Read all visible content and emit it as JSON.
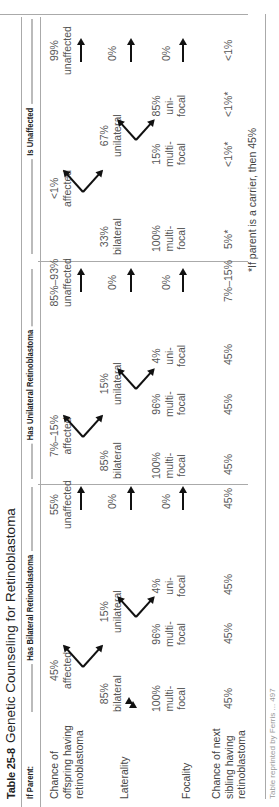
{
  "title": {
    "number": "Table 25-8",
    "text": "Genetic Counseling for Retinoblastoma"
  },
  "header": {
    "if_parent": "If Parent:",
    "groups": [
      "Has Bilateral Retinoblastoma",
      "Has Unilateral Retinoblastoma",
      "Is Unaffected"
    ]
  },
  "row_labels": {
    "offspring": [
      "Chance of",
      "offspring having",
      "retinoblastoma"
    ],
    "laterality": "Laterality",
    "focality": "Focality",
    "sibling": [
      "Chance of next",
      "sibling having",
      "retinoblastoma"
    ]
  },
  "bilateral": {
    "affected": [
      "45%",
      "affected"
    ],
    "unaffected": [
      "55%",
      "unaffected"
    ],
    "bilateral": [
      "85%",
      "bilateral"
    ],
    "unilateral": [
      "15%",
      "unilateral"
    ],
    "unaffected_laterality": "0%",
    "bil_focality": [
      "100%",
      "multi-",
      "focal"
    ],
    "uni_multi": [
      "96%",
      "multi-",
      "focal"
    ],
    "uni_uni": [
      "4%",
      "uni-",
      "focal"
    ],
    "unaffected_focality": "0%",
    "sibling": [
      "45%",
      "45%",
      "45%",
      "45%"
    ]
  },
  "unilateral": {
    "affected": [
      "7%–15%",
      "affected"
    ],
    "unaffected": [
      "85%–93%",
      "unaffected"
    ],
    "bilateral": [
      "85%",
      "bilateral"
    ],
    "unilateral": [
      "15%",
      "unilateral"
    ],
    "unaffected_laterality": "0%",
    "bil_focality": [
      "100%",
      "multi-",
      "focal"
    ],
    "uni_multi": [
      "96%",
      "multi-",
      "focal"
    ],
    "uni_uni": [
      "4%",
      "uni-",
      "focal"
    ],
    "unaffected_focality": "0%",
    "sibling": [
      "45%",
      "45%",
      "45%",
      "7%–15%"
    ]
  },
  "unaffected": {
    "affected": [
      "<1%",
      "affected"
    ],
    "unaffected": [
      "99%",
      "unaffected"
    ],
    "bilateral": [
      "33%",
      "bilateral"
    ],
    "unilateral": [
      "67%",
      "unilateral"
    ],
    "unaffected_laterality": "0%",
    "bil_focality": [
      "100%",
      "multi-",
      "focal"
    ],
    "uni_multi": [
      "15%",
      "multi-",
      "focal"
    ],
    "uni_uni": [
      "85%",
      "uni-",
      "focal"
    ],
    "unaffected_focality": "0%",
    "sibling": [
      "5%*",
      "<1%*",
      "<1%*",
      "<1%"
    ]
  },
  "footnote": "*If parent is a carrier, then 45%",
  "source_note": "Table reprinted by Ferris ... 497"
}
